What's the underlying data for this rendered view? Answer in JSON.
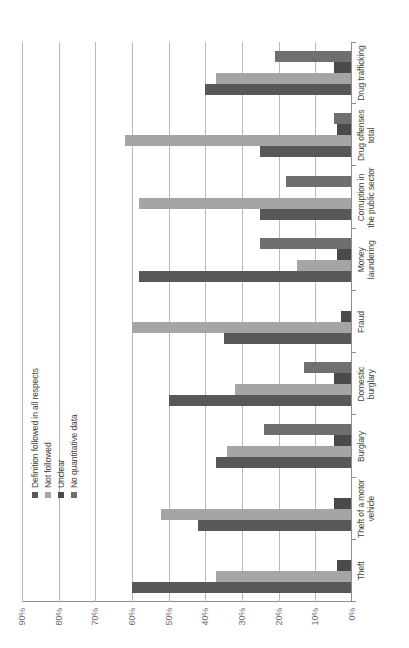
{
  "chart": {
    "type": "bar",
    "title": "",
    "xlabel": "",
    "ylabel": "",
    "orientation": "vertical-bars-rotated-90",
    "ylim": [
      0,
      90
    ],
    "ytick_labels": [
      "90%",
      "80%",
      "70%",
      "60%",
      "50%",
      "40%",
      "30%",
      "20%",
      "10%",
      "0%"
    ],
    "ytick_values": [
      90,
      80,
      70,
      60,
      50,
      40,
      30,
      20,
      10,
      0
    ],
    "grid": "horizontal",
    "legend_position": "upper-center",
    "colors": {
      "series_1": "#585858",
      "series_2": "#a5a5a5",
      "series_3": "#4a4a4a",
      "series_4": "#6f6f6f",
      "gridline": "#b9b9b9",
      "axis": "#8d8d8d",
      "text": "#3f3f3f",
      "tick_text": "#6d6d6d",
      "background": "#ffffff"
    }
  },
  "chart_data": {
    "type": "bar",
    "title": "",
    "xlabel": "",
    "ylabel": "",
    "ylim": [
      0,
      90
    ],
    "grid": true,
    "legend_position": "upper-center",
    "ytick_labels": [
      "90%",
      "80%",
      "70%",
      "60%",
      "50%",
      "40%",
      "30%",
      "20%",
      "10%",
      "0%"
    ],
    "categories": [
      "Theft",
      "Theft of a motor vehicle",
      "Burglary",
      "Domestic burglary",
      "Fraud",
      "Money laundering",
      "Corruption in the public sector",
      "Drug offenses total",
      "Drug trafficking"
    ],
    "series": [
      {
        "name": "Definition followed in all respects",
        "color": "#585858",
        "values": [
          60,
          42,
          37,
          50,
          35,
          58,
          25,
          25,
          40
        ]
      },
      {
        "name": "Not followed",
        "color": "#a5a5a5",
        "values": [
          37,
          52,
          34,
          32,
          60,
          15,
          58,
          62,
          37
        ]
      },
      {
        "name": "Unclear",
        "color": "#4a4a4a",
        "values": [
          4,
          5,
          5,
          5,
          3,
          4,
          0,
          4,
          5
        ]
      },
      {
        "name": "No quantitative data",
        "color": "#6f6f6f",
        "values": [
          0,
          0,
          24,
          13,
          0,
          25,
          18,
          5,
          21
        ]
      }
    ]
  },
  "legend": {
    "items": [
      {
        "label": "Definition followed in all respects",
        "color": "#585858"
      },
      {
        "label": "Not followed",
        "color": "#a5a5a5"
      },
      {
        "label": "Unclear",
        "color": "#4a4a4a"
      },
      {
        "label": "No quantitative data",
        "color": "#6f6f6f"
      }
    ]
  }
}
